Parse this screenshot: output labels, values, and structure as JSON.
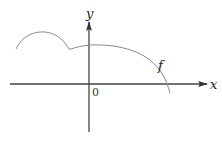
{
  "diagram": {
    "type": "function-graph",
    "axes": {
      "x_label": "x",
      "y_label": "y",
      "origin_label": "0"
    },
    "curve": {
      "label": "f",
      "description": "Function with a bump on the left, a cusp (corner) near x<0, then a broad arch that descends and crosses the positive x-axis"
    },
    "colors": {
      "axis": "#333333",
      "curve": "#888888",
      "text": "#222222"
    }
  }
}
